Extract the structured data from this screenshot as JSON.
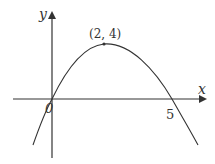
{
  "diagram": {
    "type": "function-graph",
    "axes": {
      "x_label": "x",
      "y_label": "y",
      "origin_label": "0"
    },
    "points": {
      "vertex_label": "(2, 4)",
      "vertex": {
        "x": 2,
        "y": 4
      },
      "root_label": "5",
      "roots": [
        0,
        5
      ]
    },
    "colors": {
      "curve": "#333333",
      "axes": "#333333"
    }
  }
}
